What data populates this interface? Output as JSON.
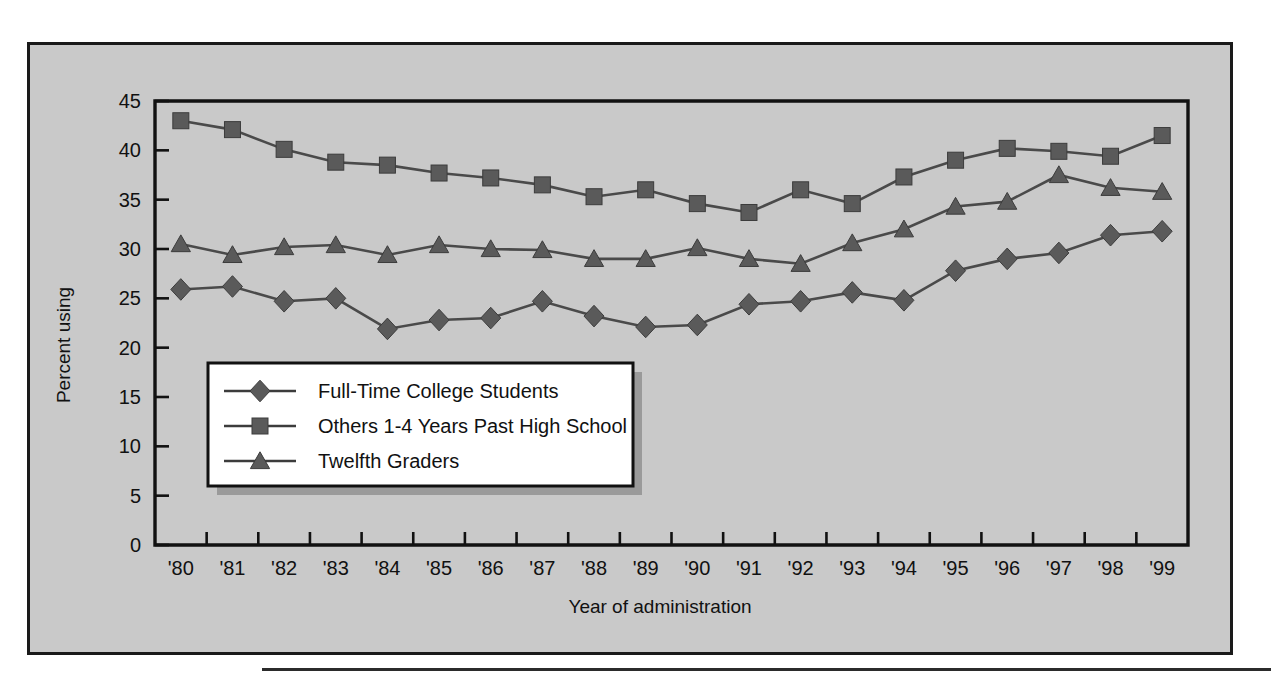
{
  "chart_data": {
    "type": "line",
    "title": "",
    "xlabel": "Year of administration",
    "ylabel": "Percent using",
    "categories": [
      "'80",
      "'81",
      "'82",
      "'83",
      "'84",
      "'85",
      "'86",
      "'87",
      "'88",
      "'89",
      "'90",
      "'91",
      "'92",
      "'93",
      "'94",
      "'95",
      "'96",
      "'97",
      "'98",
      "'99"
    ],
    "ylim": [
      0,
      45
    ],
    "yticks": [
      0,
      5,
      10,
      15,
      20,
      25,
      30,
      35,
      40,
      45
    ],
    "ytick_labels": [
      "0",
      "5",
      "10",
      "15",
      "20",
      "25",
      "30",
      "35",
      "40",
      "45"
    ],
    "grid": false,
    "legend_position": "inside-lower-left",
    "series": [
      {
        "name": "Full-Time College Students",
        "marker": "diamond",
        "values": [
          25.9,
          26.2,
          24.7,
          25.0,
          21.9,
          22.8,
          23.0,
          24.7,
          23.2,
          22.1,
          22.3,
          24.4,
          24.7,
          25.6,
          24.8,
          27.8,
          29.0,
          29.6,
          31.4,
          31.8
        ]
      },
      {
        "name": "Others 1-4 Years Past High School",
        "marker": "square",
        "values": [
          43.0,
          42.1,
          40.1,
          38.8,
          38.5,
          37.7,
          37.2,
          36.5,
          35.3,
          36.0,
          34.6,
          33.7,
          36.0,
          34.6,
          37.3,
          39.0,
          40.2,
          39.9,
          39.4,
          41.5
        ]
      },
      {
        "name": "Twelfth Graders",
        "marker": "triangle",
        "values": [
          30.5,
          29.4,
          30.2,
          30.4,
          29.4,
          30.4,
          30.0,
          29.9,
          29.0,
          29.0,
          30.1,
          29.0,
          28.5,
          30.6,
          32.0,
          34.3,
          34.8,
          37.5,
          36.2,
          35.8
        ]
      }
    ],
    "colors": {
      "marker_fill": "#5a5a5a",
      "line": "#4a4a4a",
      "axis": "#111111",
      "plot_background": "#c9c9c9",
      "legend_background": "#ffffff",
      "legend_shadow": "#9a9a9a"
    }
  }
}
